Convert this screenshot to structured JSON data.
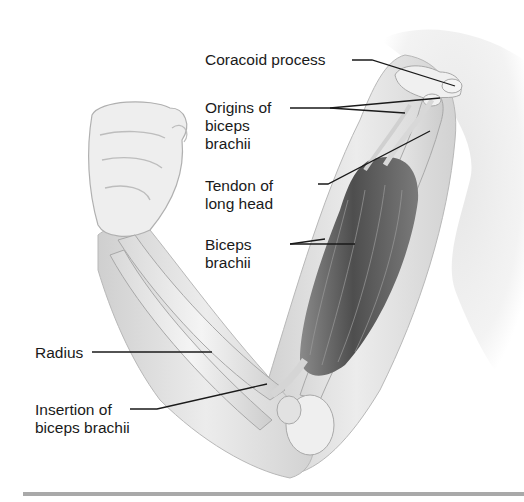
{
  "figure": {
    "colors": {
      "background": "#ffffff",
      "text": "#1a1a1a",
      "leader_line": "#1a1a1a",
      "muscle": "#5a5a5a",
      "bone": "#e8e8e8",
      "skin": "#d6d6d6",
      "rule": "#a9a9a9"
    },
    "labels": [
      {
        "id": "coracoid",
        "text": "Coracoid process"
      },
      {
        "id": "origins",
        "text": "Origins of\nbiceps\nbrachii"
      },
      {
        "id": "tendon",
        "text": "Tendon of\nlong head"
      },
      {
        "id": "biceps",
        "text": "Biceps\nbrachii"
      },
      {
        "id": "radius",
        "text": "Radius"
      },
      {
        "id": "insertion",
        "text": "Insertion of\nbiceps brachii"
      }
    ]
  }
}
